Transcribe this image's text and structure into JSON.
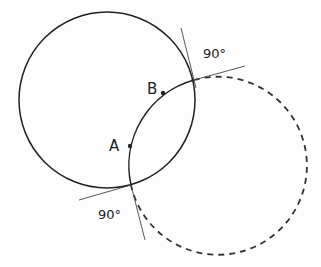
{
  "diagram": {
    "points": [
      {
        "label": "A",
        "x": 130,
        "y": 146
      },
      {
        "label": "B",
        "x": 163,
        "y": 93
      }
    ],
    "angle_labels": [
      {
        "text": "90°",
        "position": "upper-right intersection"
      },
      {
        "text": "90°",
        "position": "lower-left intersection"
      }
    ],
    "circles": [
      {
        "name": "solid-circle",
        "cx": 107,
        "cy": 100,
        "r": 88,
        "style": "solid"
      },
      {
        "name": "orthogonal-dashed-circle",
        "cx": 219,
        "cy": 166,
        "r": 89,
        "style": "dashed (arc through A and B solid)"
      }
    ],
    "colors": {
      "stroke": "#222222",
      "background": "#fdfdfd"
    }
  }
}
